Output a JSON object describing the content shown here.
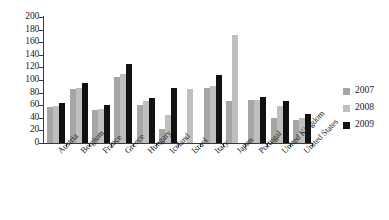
{
  "chart_data": {
    "type": "bar",
    "title": "",
    "subtitle": "",
    "xlabel": "",
    "ylabel": "",
    "ylim": [
      0,
      200
    ],
    "y_ticks": [
      0,
      20,
      40,
      60,
      80,
      100,
      120,
      140,
      160,
      180,
      200
    ],
    "grid": false,
    "legend_position": "right",
    "categories": [
      "Austria",
      "Belgium",
      "France",
      "Greece",
      "Hungary",
      "Iceland",
      "Israel",
      "Italy",
      "Japan",
      "Portugal",
      "United Kingdom",
      "United States"
    ],
    "series": [
      {
        "name": "2007",
        "color": "#a6a6a6",
        "values": [
          57,
          85,
          52,
          105,
          60,
          22,
          null,
          88,
          66,
          68,
          40,
          36
        ]
      },
      {
        "name": "2008",
        "color": "#bfbfbf",
        "values": [
          59,
          88,
          54,
          110,
          66,
          44,
          85,
          90,
          172,
          69,
          59,
          40
        ]
      },
      {
        "name": "2009",
        "color": "#111111",
        "values": [
          64,
          95,
          60,
          126,
          72,
          87,
          null,
          108,
          null,
          73,
          66,
          46
        ]
      }
    ]
  },
  "legend": {
    "items": [
      {
        "label": "2007",
        "color": "#a6a6a6"
      },
      {
        "label": "2008",
        "color": "#bfbfbf"
      },
      {
        "label": "2009",
        "color": "#111111"
      }
    ]
  },
  "axis": {
    "y_tick_labels": [
      "200",
      "180",
      "160",
      "140",
      "120",
      "100",
      "80",
      "60",
      "40",
      "20",
      "0"
    ]
  }
}
